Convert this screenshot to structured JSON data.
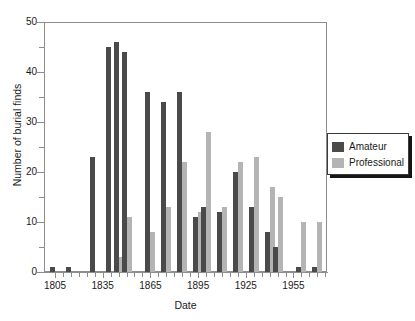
{
  "chart_data": {
    "type": "bar",
    "title": "",
    "subtitle": "",
    "xlabel": "Date",
    "ylabel": "Number of burial finds",
    "ylim": [
      0,
      50
    ],
    "ytick_major": [
      0,
      10,
      20,
      30,
      40,
      50
    ],
    "ytick_minor": [
      5,
      15,
      25,
      35,
      45
    ],
    "xtick_labels": [
      "1805",
      "1835",
      "1865",
      "1895",
      "1925",
      "1955"
    ],
    "grid": false,
    "legend_position": "right-outside",
    "bar_grouping": "grouped",
    "bin_width_years": 5,
    "categories": [
      "1805",
      "1810",
      "1815",
      "1820",
      "1825",
      "1830",
      "1835",
      "1840",
      "1845",
      "1850",
      "1855",
      "1860",
      "1865",
      "1870",
      "1875",
      "1880",
      "1885",
      "1890",
      "1895",
      "1900",
      "1905",
      "1910",
      "1915",
      "1920",
      "1925",
      "1930",
      "1935",
      "1940",
      "1945",
      "1950",
      "1955",
      "1960",
      "1965",
      "1970",
      "1975"
    ],
    "series": [
      {
        "name": "Amateur",
        "color": "#4a4a4a",
        "values": [
          1,
          0,
          1,
          0,
          0,
          23,
          0,
          45,
          46,
          44,
          0,
          0,
          36,
          0,
          34,
          0,
          36,
          0,
          11,
          13,
          0,
          12,
          0,
          20,
          0,
          13,
          0,
          8,
          5,
          0,
          0,
          1,
          0,
          1,
          0
        ]
      },
      {
        "name": "Professional",
        "color": "#b4b4b4",
        "values": [
          0,
          0,
          0,
          0,
          0,
          0,
          0,
          0,
          3,
          11,
          0,
          0,
          8,
          0,
          13,
          0,
          22,
          0,
          12,
          28,
          0,
          13,
          0,
          22,
          0,
          23,
          0,
          17,
          15,
          0,
          0,
          10,
          0,
          10,
          0
        ]
      }
    ]
  },
  "legend": {
    "entries": [
      {
        "label": "Amateur",
        "color": "#4a4a4a"
      },
      {
        "label": "Professional",
        "color": "#b4b4b4"
      }
    ]
  },
  "axes": {
    "y_title": "Number of burial finds",
    "x_title": "Date"
  }
}
